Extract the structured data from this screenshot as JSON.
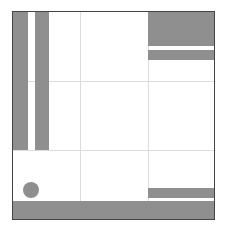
{
  "board": {
    "origin": [
      12,
      11
    ],
    "size": [
      201,
      207
    ],
    "border_color": "#444444",
    "background": "#ffffff",
    "grid": {
      "color": "#dcdcdc",
      "vertical_x": [
        67,
        135
      ],
      "horizontal_y": [
        69,
        138
      ]
    },
    "fill_color": "#8f8f8f",
    "blocks": [
      {
        "name": "left-bar-1",
        "x": 0,
        "y": 0,
        "w": 15,
        "h": 138
      },
      {
        "name": "left-bar-2",
        "x": 22,
        "y": 0,
        "w": 14,
        "h": 138
      },
      {
        "name": "top-right-block",
        "x": 135,
        "y": 0,
        "w": 66,
        "h": 34
      },
      {
        "name": "top-right-stripe",
        "x": 135,
        "y": 38,
        "w": 66,
        "h": 10
      },
      {
        "name": "bottom-right-stripe",
        "x": 135,
        "y": 176,
        "w": 66,
        "h": 10
      },
      {
        "name": "bottom-bar",
        "x": 0,
        "y": 189,
        "w": 201,
        "h": 18
      }
    ],
    "circle": {
      "cx": 18,
      "cy": 178,
      "r": 8
    }
  }
}
